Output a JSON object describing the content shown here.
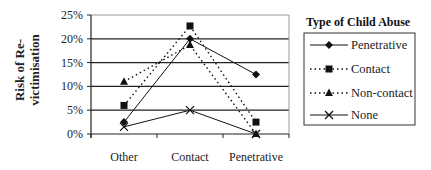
{
  "chart_data": {
    "type": "line",
    "title": "",
    "xlabel": "",
    "ylabel": "Risk of Re-victimisation",
    "ylabel_lines": [
      "Risk of Re-",
      "victimisation"
    ],
    "categories": [
      "Other",
      "Contact",
      "Penetrative"
    ],
    "yticks": [
      "0%",
      "5%",
      "10%",
      "15%",
      "20%",
      "25%"
    ],
    "ylim": [
      0,
      25
    ],
    "grid": true,
    "legend_title": "Type of Child Abuse",
    "legend_position": "right",
    "series": [
      {
        "name": "Penetrative",
        "marker": "diamond",
        "line": "solid",
        "values": [
          2.5,
          20,
          12.5
        ]
      },
      {
        "name": "Contact",
        "marker": "square",
        "line": "dotted",
        "values": [
          6,
          22.7,
          2.5
        ]
      },
      {
        "name": "Non-contact",
        "marker": "triangle",
        "line": "dotted",
        "values": [
          11,
          18.7,
          0
        ]
      },
      {
        "name": "None",
        "marker": "x",
        "line": "solid",
        "values": [
          1.5,
          5,
          0
        ]
      }
    ]
  },
  "colors": {
    "line": "#111111",
    "grid": "#222222",
    "axis": "#222222"
  }
}
